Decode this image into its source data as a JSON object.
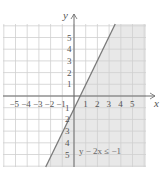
{
  "chart_data": {
    "type": "line",
    "title": "",
    "xlabel": "x",
    "ylabel": "y",
    "xlim": [
      -6,
      6
    ],
    "ylim": [
      -6,
      6
    ],
    "grid": true,
    "x_ticks": [
      "-5",
      "-4",
      "-3",
      "-2",
      "-1",
      "1",
      "2",
      "3",
      "4",
      "5"
    ],
    "y_ticks": [
      "5",
      "4",
      "3",
      "2",
      "1",
      "-1",
      "-2",
      "-3",
      "-4",
      "-5"
    ],
    "boundary_line": {
      "equation": "y = 2x - 1",
      "slope": 2,
      "intercept": -1,
      "style": "solid"
    },
    "shaded_region": "below-right of line (y - 2x ≤ -1)",
    "annotation": "y − 2x ≤ −1",
    "colors": {
      "shade": "#e8e8e8",
      "grid": "#cfcfcf",
      "line": "#7a7a7a",
      "axis": "#6a6a6a"
    }
  }
}
